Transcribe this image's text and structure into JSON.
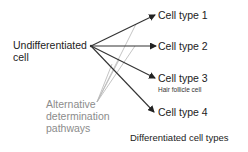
{
  "diagram": {
    "source": {
      "label_line1": "Undifferentiated",
      "label_line2": "cell"
    },
    "targets": [
      {
        "label": "Cell type 1",
        "sublabel": ""
      },
      {
        "label": "Cell type 2",
        "sublabel": ""
      },
      {
        "label": "Cell type 3",
        "sublabel": "Hair follicle cell"
      },
      {
        "label": "Cell type 4",
        "sublabel": ""
      }
    ],
    "pathways_label": {
      "line1": "Alternative",
      "line2": "determination",
      "line3": "pathways"
    },
    "footer_label": "Differentiated cell types",
    "colors": {
      "arrow": "#333333",
      "pathway_lines": "#b0b0b0",
      "pathway_text": "#8c8c8c",
      "text": "#222222"
    }
  }
}
